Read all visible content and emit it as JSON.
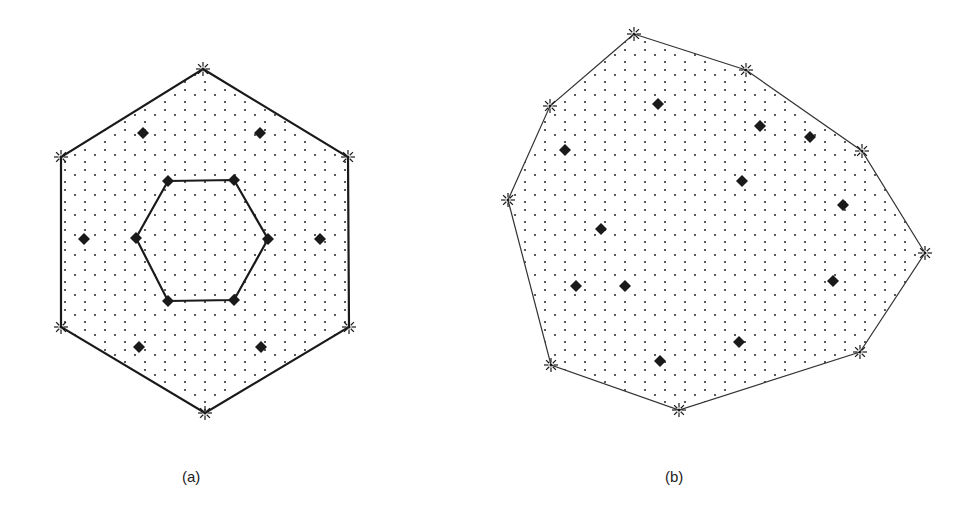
{
  "colors": {
    "background": "#ffffff",
    "ink": "#1a1a1a",
    "dot": "#333333"
  },
  "panels": [
    {
      "label": "(a)",
      "outer_polygon": [
        [
          203,
          69
        ],
        [
          348,
          157
        ],
        [
          349,
          327
        ],
        [
          205,
          413
        ],
        [
          61,
          327
        ],
        [
          61,
          157
        ]
      ],
      "outer_stroke_width": 2.2,
      "inner_polygon": [
        [
          168,
          181
        ],
        [
          234,
          180
        ],
        [
          268,
          239
        ],
        [
          234,
          300
        ],
        [
          168,
          301
        ],
        [
          136,
          238
        ]
      ],
      "inner_stroke_width": 2.2,
      "vertex_markers": "asterisk",
      "diamond_markers": [
        [
          143,
          133
        ],
        [
          260,
          133
        ],
        [
          84,
          239
        ],
        [
          320,
          239
        ],
        [
          139,
          347
        ],
        [
          261,
          347
        ],
        [
          168,
          181
        ],
        [
          234,
          180
        ],
        [
          268,
          239
        ],
        [
          234,
          300
        ],
        [
          168,
          301
        ],
        [
          136,
          238
        ]
      ]
    },
    {
      "label": "(b)",
      "outer_polygon": [
        [
          634,
          34
        ],
        [
          746,
          70
        ],
        [
          862,
          151
        ],
        [
          925,
          253
        ],
        [
          860,
          352
        ],
        [
          679,
          410
        ],
        [
          551,
          365
        ],
        [
          508,
          200
        ],
        [
          550,
          106
        ]
      ],
      "outer_stroke_width": 1.2,
      "vertex_markers": "asterisk",
      "diamond_markers": [
        [
          658,
          104
        ],
        [
          760,
          126
        ],
        [
          810,
          137
        ],
        [
          565,
          150
        ],
        [
          742,
          181
        ],
        [
          843,
          205
        ],
        [
          601,
          229
        ],
        [
          576,
          286
        ],
        [
          625,
          286
        ],
        [
          833,
          281
        ],
        [
          739,
          342
        ],
        [
          660,
          361
        ]
      ]
    }
  ]
}
